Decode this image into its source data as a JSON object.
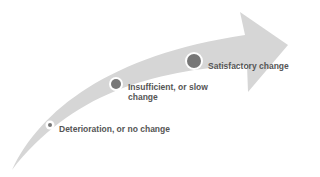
{
  "diagram": {
    "type": "progress-arrow",
    "colors": {
      "arrow": "#d6d6d6",
      "marker": "#777777",
      "marker_ring": "#ffffff",
      "text": "#555555"
    },
    "stages": [
      {
        "label": "Deterioration, or no change",
        "marker_size": "small"
      },
      {
        "label_line1": "Insufficient, or slow",
        "label_line2": "change",
        "marker_size": "medium"
      },
      {
        "label": "Satisfactory change",
        "marker_size": "large"
      }
    ]
  }
}
